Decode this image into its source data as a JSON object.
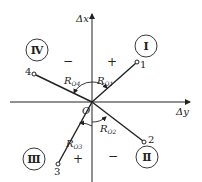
{
  "diagram": {
    "axes": {
      "vertical_label": "Δx",
      "horizontal_label": "Δy",
      "origin_label": "O"
    },
    "points": [
      {
        "id": "1",
        "label": "1",
        "quadrant": "I"
      },
      {
        "id": "2",
        "label": "2",
        "quadrant": "II"
      },
      {
        "id": "3",
        "label": "3",
        "quadrant": "III"
      },
      {
        "id": "4",
        "label": "4",
        "quadrant": "IV"
      }
    ],
    "quadrants": [
      {
        "numeral": "Ⅰ",
        "sign": "+"
      },
      {
        "numeral": "Ⅱ",
        "sign": "−"
      },
      {
        "numeral": "Ⅲ",
        "sign": "+"
      },
      {
        "numeral": "Ⅳ",
        "sign": "−"
      }
    ],
    "angles": [
      {
        "main": "R",
        "sub": "O1"
      },
      {
        "main": "R",
        "sub": "O2"
      },
      {
        "main": "R",
        "sub": "O3"
      },
      {
        "main": "R",
        "sub": "O4"
      }
    ],
    "colors": {
      "stroke": "#222222",
      "background": "#ffffff"
    }
  }
}
